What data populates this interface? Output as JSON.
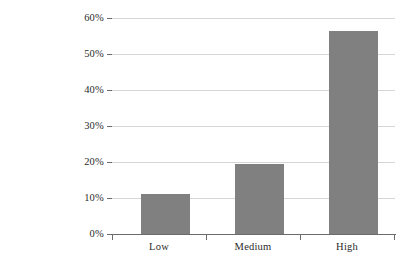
{
  "chart_data": {
    "type": "bar",
    "title": "",
    "subtitle": "",
    "xlabel": "",
    "ylabel": "",
    "categories": [
      "Low",
      "Medium",
      "High"
    ],
    "values": [
      11.0,
      19.5,
      56.5
    ],
    "value_labels": [
      "11%",
      "19.5%",
      "56.5%"
    ],
    "series": [
      {
        "name": "",
        "values": [
          11.0,
          19.5,
          56.5
        ]
      }
    ],
    "ylim": [
      0,
      60
    ],
    "ytick_values": [
      0,
      10,
      20,
      30,
      40,
      50,
      60
    ],
    "ytick_labels": [
      "0%",
      "10%",
      "20%",
      "30%",
      "40%",
      "50%",
      "60%"
    ],
    "xtick_labels": [
      "Low",
      "Medium",
      "High"
    ],
    "grid": true,
    "grid_axis": "y",
    "legend": false,
    "legend_position": "none",
    "bar_color": "#808080",
    "gridline_color": "#d6d6d6",
    "axis_color": "#6b6b6b",
    "background_color": "#ffffff",
    "annotations": []
  }
}
